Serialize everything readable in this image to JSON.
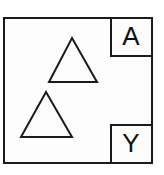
{
  "figure": {
    "background_color": "#fdfdfd",
    "stroke_color": "#1a1a1a",
    "frame": {
      "name": "outer-rectangle",
      "x": 4,
      "y": 18,
      "width": 148,
      "height": 145,
      "stroke_width": 2
    },
    "shapes": [
      {
        "name": "triangle-upper",
        "type": "triangle",
        "apex": [
          72,
          38
        ],
        "base_left": [
          49,
          82
        ],
        "base_right": [
          97,
          82
        ],
        "stroke_width": 2,
        "fill": "none"
      },
      {
        "name": "triangle-lower",
        "type": "triangle",
        "apex": [
          46,
          92
        ],
        "base_left": [
          21,
          137
        ],
        "base_right": [
          72,
          137
        ],
        "stroke_width": 2,
        "fill": "none"
      }
    ],
    "label_boxes": [
      {
        "name": "label-box-a",
        "letter": "A",
        "x": 111,
        "y": 18,
        "width": 41,
        "height": 38,
        "stroke_width": 2,
        "text_x": 131,
        "text_y": 38
      },
      {
        "name": "label-box-y",
        "letter": "Y",
        "x": 111,
        "y": 125,
        "width": 41,
        "height": 38,
        "stroke_width": 2,
        "text_x": 131,
        "text_y": 145
      }
    ]
  }
}
